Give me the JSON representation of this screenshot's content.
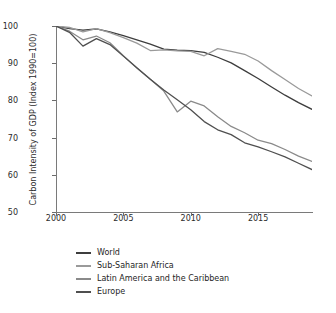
{
  "chart_data": {
    "type": "line",
    "title": "",
    "xlabel": "",
    "ylabel": "Carbon Intensity of GDP (Index 1990=100)",
    "xlim": [
      2000,
      2019
    ],
    "ylim": [
      50,
      100
    ],
    "yticks": [
      50,
      60,
      70,
      80,
      90,
      100
    ],
    "xticks": [
      2000,
      2005,
      2010,
      2015
    ],
    "xtick_labels": [
      "2000",
      "2005",
      "2010",
      "2015"
    ],
    "ytick_labels": [
      "50",
      "60",
      "70",
      "80",
      "90",
      "100"
    ],
    "grid": false,
    "legend_position": "below",
    "x": [
      2000,
      2001,
      2002,
      2003,
      2004,
      2005,
      2006,
      2007,
      2008,
      2009,
      2010,
      2011,
      2012,
      2013,
      2014,
      2015,
      2016,
      2017,
      2018,
      2019
    ],
    "series": [
      {
        "name": "World",
        "color": "#3d3d3d",
        "values": [
          100.0,
          99.3,
          98.9,
          99.2,
          98.4,
          97.4,
          96.3,
          95.1,
          93.8,
          93.5,
          93.4,
          92.9,
          91.6,
          90.1,
          88.0,
          85.9,
          83.6,
          81.4,
          79.4,
          77.6
        ]
      },
      {
        "name": "Sub-Saharan Africa",
        "color": "#9a9a9a",
        "values": [
          100.0,
          99.6,
          98.4,
          99.3,
          98.2,
          96.9,
          95.4,
          93.4,
          93.6,
          93.3,
          93.2,
          92.0,
          93.9,
          93.2,
          92.4,
          90.6,
          88.0,
          85.6,
          83.2,
          81.2
        ]
      },
      {
        "name": "Latin America and the Caribbean",
        "color": "#8a8a8a",
        "values": [
          100.0,
          98.6,
          96.3,
          97.3,
          95.5,
          92.0,
          88.7,
          85.7,
          82.5,
          76.9,
          79.8,
          78.5,
          75.6,
          73.0,
          71.3,
          69.3,
          68.4,
          66.8,
          65.0,
          63.6
        ]
      },
      {
        "name": "Europe",
        "color": "#4f4f4f",
        "values": [
          100.0,
          98.3,
          94.6,
          96.6,
          95.0,
          91.9,
          88.8,
          85.7,
          82.8,
          80.2,
          77.5,
          74.3,
          72.1,
          70.8,
          68.6,
          67.5,
          66.2,
          64.8,
          63.1,
          61.4
        ]
      }
    ]
  },
  "legend": {
    "items": [
      {
        "label": "World"
      },
      {
        "label": "Sub-Saharan Africa"
      },
      {
        "label": "Latin America and the Caribbean"
      },
      {
        "label": "Europe"
      }
    ]
  }
}
